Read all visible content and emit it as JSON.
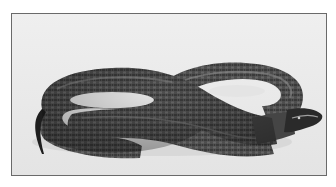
{
  "image": {
    "alt": "Black-and-white photograph of a coiled snake in a figure-eight loop with its head pointing right",
    "subject": "snake",
    "style": "grayscale photograph with thin gray border",
    "colors": {
      "background": "#ececec",
      "border": "#6a6a6a",
      "body_dark": "#3a3a3a",
      "body_mid": "#5c5c5c",
      "belly_light": "#9a9a9a",
      "head": "#2a2a2a"
    }
  }
}
